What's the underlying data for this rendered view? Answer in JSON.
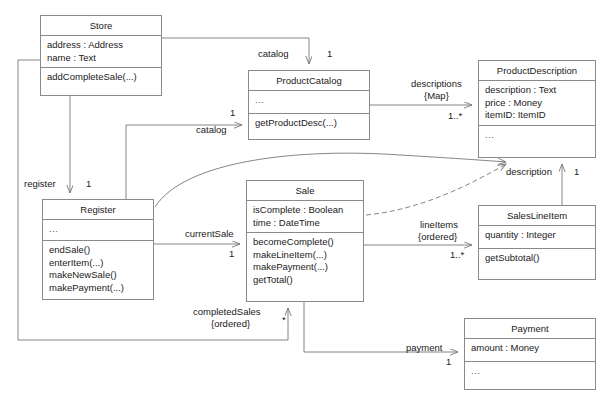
{
  "diagram": {
    "type": "uml-class-diagram"
  },
  "classes": [
    {
      "id": "store",
      "name": "Store",
      "attributes": [
        "address : Address",
        "name : Text"
      ],
      "operations": [
        "addCompleteSale(...)"
      ],
      "x": 40,
      "y": 15,
      "width": 122,
      "height": 81
    },
    {
      "id": "product-catalog",
      "name": "ProductCatalog",
      "attributes": [
        "..."
      ],
      "operations": [
        "getProductDesc(...)"
      ],
      "x": 248,
      "y": 70,
      "width": 122,
      "height": 70
    },
    {
      "id": "product-description",
      "name": "ProductDescription",
      "attributes": [
        "description : Text",
        "price : Money",
        "itemID: ItemID"
      ],
      "operations": [
        "..."
      ],
      "x": 478,
      "y": 60,
      "width": 118,
      "height": 98
    },
    {
      "id": "register",
      "name": "Register",
      "attributes": [
        "..."
      ],
      "operations": [
        "endSale()",
        "enterItem(...)",
        "makeNewSale()",
        "makePayment(...)"
      ],
      "x": 42,
      "y": 199,
      "width": 112,
      "height": 101
    },
    {
      "id": "sale",
      "name": "Sale",
      "attributes": [
        "isComplete : Boolean",
        "time : DateTime"
      ],
      "operations": [
        "becomeComplete()",
        "makeLineItem(...)",
        "makePayment(...)",
        "getTotal()"
      ],
      "x": 246,
      "y": 180,
      "width": 118,
      "height": 122
    },
    {
      "id": "sales-line-item",
      "name": "SalesLineItem",
      "attributes": [
        "quantity : Integer"
      ],
      "operations": [
        "getSubtotal()"
      ],
      "x": 478,
      "y": 205,
      "width": 118,
      "height": 75
    },
    {
      "id": "payment",
      "name": "Payment",
      "attributes": [
        "amount : Money"
      ],
      "operations": [
        "..."
      ],
      "x": 464,
      "y": 318,
      "width": 132,
      "height": 72
    }
  ],
  "associations": [
    {
      "id": "store-catalog",
      "from": "store",
      "to": "product-catalog",
      "role": "catalog",
      "multiplicity": "1",
      "role_x": 258,
      "role_y": 48,
      "mult_x": 327,
      "mult_y": 48
    },
    {
      "id": "register-catalog",
      "from": "register",
      "to": "product-catalog",
      "role": "catalog",
      "multiplicity": "1",
      "role_x": 196,
      "role_y": 124,
      "mult_x": 230,
      "mult_y": 107
    },
    {
      "id": "store-register",
      "from": "store",
      "to": "register",
      "role": "register",
      "multiplicity": "1",
      "role_x": 24,
      "role_y": 178,
      "mult_x": 86,
      "mult_y": 178
    },
    {
      "id": "catalog-descriptions",
      "from": "product-catalog",
      "to": "product-description",
      "role": "descriptions",
      "role2": "{Map}",
      "multiplicity": "1..*",
      "role_x": 411,
      "role_y": 81,
      "role2_x": 424,
      "role2_y": 93,
      "mult_x": 448,
      "mult_y": 112
    },
    {
      "id": "register-currentsale",
      "from": "register",
      "to": "sale",
      "role": "currentSale",
      "multiplicity": "1",
      "role_x": 185,
      "role_y": 228,
      "mult_x": 229,
      "mult_y": 248
    },
    {
      "id": "store-completedsales",
      "from": "store",
      "to": "sale",
      "role": "completedSales",
      "role2": "{ordered}",
      "multiplicity": "*",
      "role_x": 196,
      "role_y": 308,
      "role2_x": 211,
      "role2_y": 320,
      "mult_x": 282,
      "mult_y": 318
    },
    {
      "id": "sale-lineitems",
      "from": "sale",
      "to": "sales-line-item",
      "role": "lineItems",
      "role2": "{ordered}",
      "multiplicity": "1..*",
      "role_x": 420,
      "role_y": 222,
      "role2_x": 418,
      "role2_y": 234,
      "mult_x": 452,
      "mult_y": 252
    },
    {
      "id": "lineitem-description",
      "from": "sales-line-item",
      "to": "product-description",
      "role": "description",
      "multiplicity": "1",
      "role_x": 508,
      "role_y": 167,
      "mult_x": 574,
      "mult_y": 167
    },
    {
      "id": "sale-payment",
      "from": "sale",
      "to": "payment",
      "role": "payment",
      "multiplicity": "1",
      "role_x": 409,
      "role_y": 345,
      "mult_x": 448,
      "mult_y": 359
    }
  ],
  "dependencies": [
    {
      "id": "sale-productdescription-dependency",
      "from": "sale",
      "to": "product-description",
      "style": "dashed"
    },
    {
      "id": "register-productdescription-association",
      "from": "register",
      "to": "product-description",
      "style": "solid-curve"
    }
  ],
  "colors": {
    "line": "#8a8a8a",
    "edge": "#777777",
    "text": "#1a1a1a",
    "background": "#ffffff"
  }
}
